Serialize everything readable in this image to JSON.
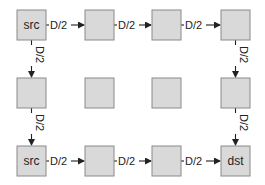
{
  "diagram": {
    "grid": {
      "rows": 3,
      "cols": 4
    },
    "nodes": [
      {
        "id": "n00",
        "row": 0,
        "col": 0,
        "label": "src"
      },
      {
        "id": "n01",
        "row": 0,
        "col": 1,
        "label": ""
      },
      {
        "id": "n02",
        "row": 0,
        "col": 2,
        "label": ""
      },
      {
        "id": "n03",
        "row": 0,
        "col": 3,
        "label": ""
      },
      {
        "id": "n10",
        "row": 1,
        "col": 0,
        "label": ""
      },
      {
        "id": "n11",
        "row": 1,
        "col": 1,
        "label": ""
      },
      {
        "id": "n12",
        "row": 1,
        "col": 2,
        "label": ""
      },
      {
        "id": "n13",
        "row": 1,
        "col": 3,
        "label": ""
      },
      {
        "id": "n20",
        "row": 2,
        "col": 0,
        "label": "src"
      },
      {
        "id": "n21",
        "row": 2,
        "col": 1,
        "label": ""
      },
      {
        "id": "n22",
        "row": 2,
        "col": 2,
        "label": ""
      },
      {
        "id": "n23",
        "row": 2,
        "col": 3,
        "label": "dst"
      }
    ],
    "edges": [
      {
        "from": "n00",
        "to": "n01",
        "label": "D/2",
        "dir": "horizontal"
      },
      {
        "from": "n01",
        "to": "n02",
        "label": "D/2",
        "dir": "horizontal"
      },
      {
        "from": "n02",
        "to": "n03",
        "label": "D/2",
        "dir": "horizontal"
      },
      {
        "from": "n00",
        "to": "n10",
        "label": "D/2",
        "dir": "vertical"
      },
      {
        "from": "n03",
        "to": "n13",
        "label": "D/2",
        "dir": "vertical"
      },
      {
        "from": "n10",
        "to": "n20",
        "label": "D/2",
        "dir": "vertical"
      },
      {
        "from": "n13",
        "to": "n23",
        "label": "D/2",
        "dir": "vertical"
      },
      {
        "from": "n20",
        "to": "n21",
        "label": "D/2",
        "dir": "horizontal"
      },
      {
        "from": "n21",
        "to": "n22",
        "label": "D/2",
        "dir": "horizontal"
      },
      {
        "from": "n22",
        "to": "n23",
        "label": "D/2",
        "dir": "horizontal"
      }
    ],
    "colors": {
      "node_fill": "#d9d9d9",
      "node_stroke": "#8a8a8a",
      "edge": "#222222"
    }
  }
}
